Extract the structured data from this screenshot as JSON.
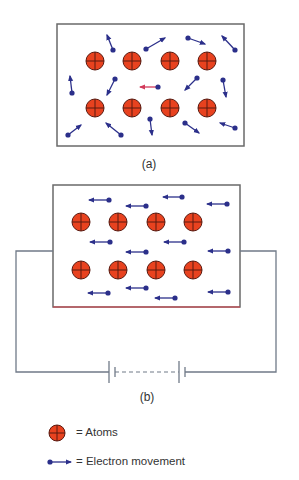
{
  "colors": {
    "atom_fill": "#e8421f",
    "atom_stroke": "#5a1a10",
    "electron": "#2b2f8a",
    "electron_highlight_line": "#d23a5a",
    "box_border": "#6a6a6a",
    "wire": "#707a88",
    "box_b_bottom": "#d9404a"
  },
  "panels": [
    {
      "id": "a",
      "label": "(a)",
      "description": "Random electron motion without applied voltage",
      "box": {
        "x": 57,
        "y": 24,
        "w": 187,
        "h": 122
      },
      "atoms": [
        {
          "x": 95,
          "y": 61
        },
        {
          "x": 132,
          "y": 61
        },
        {
          "x": 170,
          "y": 61
        },
        {
          "x": 207,
          "y": 61
        },
        {
          "x": 95,
          "y": 108
        },
        {
          "x": 132,
          "y": 108
        },
        {
          "x": 170,
          "y": 108
        },
        {
          "x": 207,
          "y": 108
        }
      ],
      "electrons": [
        {
          "x": 113,
          "y": 50,
          "tx": 107,
          "ty": 35
        },
        {
          "x": 146,
          "y": 49,
          "tx": 165,
          "ty": 38
        },
        {
          "x": 188,
          "y": 38,
          "tx": 205,
          "ty": 44
        },
        {
          "x": 235,
          "y": 50,
          "tx": 222,
          "ty": 36
        },
        {
          "x": 72,
          "y": 93,
          "tx": 70,
          "ty": 76
        },
        {
          "x": 115,
          "y": 79,
          "tx": 107,
          "ty": 95
        },
        {
          "x": 158,
          "y": 87,
          "tx": 140,
          "ty": 87,
          "highlight": true
        },
        {
          "x": 197,
          "y": 78,
          "tx": 185,
          "ty": 90
        },
        {
          "x": 223,
          "y": 80,
          "tx": 226,
          "ty": 97
        },
        {
          "x": 68,
          "y": 135,
          "tx": 81,
          "ty": 125
        },
        {
          "x": 121,
          "y": 135,
          "tx": 106,
          "ty": 123
        },
        {
          "x": 150,
          "y": 119,
          "tx": 152,
          "ty": 135
        },
        {
          "x": 185,
          "y": 123,
          "tx": 199,
          "ty": 133
        },
        {
          "x": 235,
          "y": 128,
          "tx": 220,
          "ty": 123
        }
      ]
    },
    {
      "id": "b",
      "label": "(b)",
      "description": "Directed electron flow with battery connected",
      "box": {
        "x": 53,
        "y": 185,
        "w": 187,
        "h": 122
      },
      "atoms": [
        {
          "x": 81,
          "y": 222
        },
        {
          "x": 118,
          "y": 222
        },
        {
          "x": 156,
          "y": 222
        },
        {
          "x": 193,
          "y": 222
        },
        {
          "x": 81,
          "y": 270
        },
        {
          "x": 118,
          "y": 270
        },
        {
          "x": 156,
          "y": 270
        },
        {
          "x": 193,
          "y": 270
        }
      ],
      "electrons": [
        {
          "x": 109,
          "y": 200,
          "tx": 89,
          "ty": 200
        },
        {
          "x": 146,
          "y": 206,
          "tx": 126,
          "ty": 206
        },
        {
          "x": 182,
          "y": 197,
          "tx": 163,
          "ty": 197
        },
        {
          "x": 227,
          "y": 204,
          "tx": 207,
          "ty": 204
        },
        {
          "x": 110,
          "y": 242,
          "tx": 90,
          "ty": 242
        },
        {
          "x": 146,
          "y": 252,
          "tx": 126,
          "ty": 252
        },
        {
          "x": 184,
          "y": 242,
          "tx": 164,
          "ty": 242
        },
        {
          "x": 228,
          "y": 251,
          "tx": 208,
          "ty": 251
        },
        {
          "x": 108,
          "y": 293,
          "tx": 88,
          "ty": 293
        },
        {
          "x": 146,
          "y": 288,
          "tx": 126,
          "ty": 288
        },
        {
          "x": 175,
          "y": 298,
          "tx": 155,
          "ty": 298
        },
        {
          "x": 228,
          "y": 292,
          "tx": 208,
          "ty": 292
        }
      ],
      "circuit": {
        "wire_y": 251,
        "left_x": 16,
        "right_x": 276,
        "bottom_y": 372,
        "battery_cells": [
          {
            "long_x": 109,
            "short_x": 115
          },
          {
            "long_x": 179,
            "short_x": 185
          }
        ]
      }
    }
  ],
  "legend": {
    "atoms_label": "= Atoms",
    "electron_label": "= Electron movement"
  }
}
